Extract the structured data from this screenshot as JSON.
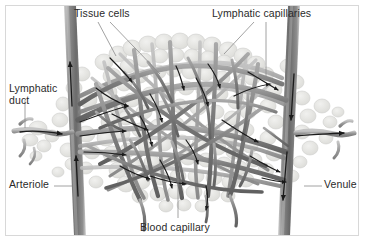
{
  "figure": {
    "style": "grayscale anatomical illustration",
    "background_color": "#ffffff",
    "frame_color": "#d8d8d8",
    "label_color": "#2a2a2a"
  },
  "labels": {
    "tissue_cells": "Tissue cells",
    "lymphatic_capillaries": "Lymphatic capillaries",
    "lymphatic_duct": "Lymphatic\nduct",
    "arteriole": "Arteriole",
    "venule": "Venule",
    "blood_capillary": "Blood capillary"
  },
  "colors": {
    "vessel_dark": "#6f6f6f",
    "vessel_mid": "#8c8c8c",
    "vessel_light": "#b4b4b4",
    "trunk_dark": "#7a7a7a",
    "tissue_fill": "#e4e4e2",
    "tissue_edge": "#cfcfcc",
    "arrow": "#1a1a1a",
    "leader": "#8a8a8a"
  },
  "structures": {
    "arteriole_flow_direction": "upward",
    "venule_flow_direction": "downward",
    "lymph_inflow": "left to right",
    "lymph_outflow": "left to right"
  }
}
